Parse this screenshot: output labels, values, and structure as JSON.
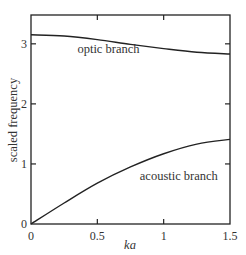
{
  "chart_data": {
    "type": "line",
    "title": "",
    "xlabel": "ka",
    "ylabel": "scaled frequency",
    "xlim": [
      0,
      1.5
    ],
    "ylim": [
      0,
      3.48
    ],
    "xticks": [
      0,
      0.5,
      1,
      1.5
    ],
    "xtick_labels": [
      "0",
      "0.5",
      "1",
      "1.5"
    ],
    "yticks": [
      0,
      1,
      2,
      3
    ],
    "ytick_labels": [
      "0",
      "1",
      "2",
      "3"
    ],
    "grid": false,
    "legend": "none (inline labels)",
    "series": [
      {
        "name": "optic branch",
        "x": [
          0,
          0.25,
          0.5,
          0.75,
          1.0,
          1.25,
          1.5
        ],
        "values": [
          3.15,
          3.13,
          3.07,
          2.99,
          2.92,
          2.86,
          2.83
        ]
      },
      {
        "name": "acoustic branch",
        "x": [
          0,
          0.25,
          0.5,
          0.75,
          1.0,
          1.25,
          1.5
        ],
        "values": [
          0,
          0.35,
          0.68,
          0.95,
          1.17,
          1.33,
          1.41
        ]
      }
    ],
    "annotations": [
      {
        "text": "optic branch",
        "x": 0.35,
        "y": 2.85
      },
      {
        "text": "acoustic branch",
        "x": 0.82,
        "y": 0.73
      }
    ]
  }
}
